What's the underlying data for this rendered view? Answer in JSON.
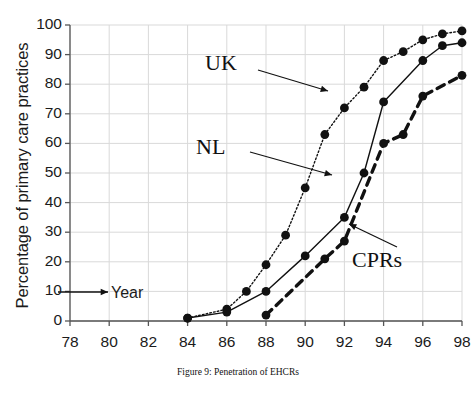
{
  "caption": "Figure 9:  Penetration of EHCRs",
  "axes": {
    "ylabel": "Percentage of primary care practices",
    "xlabel_annotation": "Year",
    "yticks": [
      "0",
      "10",
      "20",
      "30",
      "40",
      "50",
      "60",
      "70",
      "80",
      "90",
      "100"
    ],
    "xticks": [
      "78",
      "80",
      "82",
      "84",
      "86",
      "88",
      "90",
      "92",
      "94",
      "96",
      "98"
    ]
  },
  "labels": {
    "uk": "UK",
    "nl": "NL",
    "cprs": "CPRs"
  },
  "colors": {
    "ink": "#111111",
    "grid": "#d9d9d9",
    "axis": "#555555"
  },
  "chart_data": {
    "type": "line",
    "title": "Figure 9:  Penetration of EHCRs",
    "xlabel": "Year",
    "ylabel": "Percentage of primary care practices",
    "xlim": [
      78,
      98
    ],
    "ylim": [
      0,
      100
    ],
    "xticks": [
      78,
      80,
      82,
      84,
      86,
      88,
      90,
      92,
      94,
      96,
      98
    ],
    "yticks": [
      0,
      10,
      20,
      30,
      40,
      50,
      60,
      70,
      80,
      90,
      100
    ],
    "grid": true,
    "legend": "inline-annotations",
    "series": [
      {
        "name": "UK",
        "style": "dotted",
        "marker": "filled-circle",
        "x": [
          84,
          86,
          87,
          88,
          89,
          90,
          91,
          92,
          93,
          94,
          95,
          96,
          97,
          98
        ],
        "values": [
          1,
          4,
          10,
          19,
          29,
          45,
          63,
          72,
          79,
          88,
          91,
          95,
          97,
          98
        ]
      },
      {
        "name": "NL",
        "style": "solid",
        "marker": "filled-circle",
        "x": [
          84,
          86,
          88,
          90,
          92,
          93,
          94,
          96,
          97,
          98
        ],
        "values": [
          1,
          3,
          10,
          22,
          35,
          50,
          74,
          88,
          93,
          94
        ]
      },
      {
        "name": "CPRs",
        "style": "dashed",
        "marker": "filled-circle",
        "x": [
          88,
          91,
          92,
          94,
          95,
          96,
          98
        ],
        "values": [
          2,
          21,
          27,
          60,
          63,
          76,
          83
        ]
      }
    ],
    "annotations": [
      {
        "text": "UK",
        "points_to_series": "UK",
        "points_to_x": 92,
        "points_to_y": 72
      },
      {
        "text": "NL",
        "points_to_series": "NL",
        "points_to_x": 92,
        "points_to_y": 35
      },
      {
        "text": "CPRs",
        "points_to_series": "CPRs",
        "points_to_x": 92.6,
        "points_to_y": 31
      },
      {
        "text": "Year",
        "type": "axis-note"
      }
    ]
  }
}
